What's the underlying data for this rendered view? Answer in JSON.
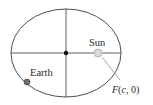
{
  "diagram": {
    "type": "ellipse-orbit",
    "ellipse": {
      "cx": 66,
      "cy": 53,
      "rx": 55,
      "ry": 44,
      "stroke": "#3a3a3a"
    },
    "axes": {
      "horizontal": {
        "x1": 11,
        "y1": 53,
        "x2": 121,
        "y2": 53
      },
      "vertical": {
        "x1": 66,
        "y1": 9,
        "x2": 66,
        "y2": 97
      },
      "stroke": "#3a3a3a"
    },
    "center": {
      "x": 66,
      "y": 53,
      "r": 2.2,
      "fill": "#111111"
    },
    "sun": {
      "label": "Sun",
      "x": 98,
      "y": 53,
      "r": 4,
      "fill": "#d9d9d9",
      "stroke": "#a8a8a8",
      "label_x": 89,
      "label_y": 46
    },
    "earth": {
      "label": "Earth",
      "x": 27,
      "y": 82,
      "r": 3,
      "fill": "#6e6e6e",
      "stroke": "#3a3a3a",
      "label_x": 30,
      "label_y": 76
    },
    "focus": {
      "label_prefix": "F",
      "label_open": "(",
      "label_var": "c",
      "label_rest": ", 0)",
      "label_x": 112,
      "label_y": 93,
      "leader": {
        "x1": 102,
        "y1": 57,
        "x2": 120,
        "y2": 80,
        "stroke": "#8a8a8a"
      }
    }
  }
}
